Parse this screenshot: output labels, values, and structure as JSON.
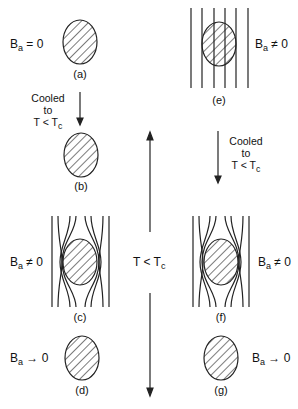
{
  "diagram": {
    "panels": [
      {
        "id": "a",
        "caption": "(a)",
        "field_label": "B",
        "field_sub": "a",
        "field_rel": " = 0"
      },
      {
        "id": "b",
        "caption": "(b)"
      },
      {
        "id": "c",
        "caption": "(c)",
        "field_label": "B",
        "field_sub": "a",
        "field_rel": " ≠ 0"
      },
      {
        "id": "d",
        "caption": "(d)",
        "field_label": "B",
        "field_sub": "a",
        "field_rel": " → 0"
      },
      {
        "id": "e",
        "caption": "(e)",
        "field_label": "B",
        "field_sub": "a",
        "field_rel": " ≠ 0"
      },
      {
        "id": "f",
        "caption": "(f)",
        "field_label": "B",
        "field_sub": "a",
        "field_rel": " ≠ 0"
      },
      {
        "id": "g",
        "caption": "(g)",
        "field_label": "B",
        "field_sub": "a",
        "field_rel": " → 0"
      }
    ],
    "cooling_left": {
      "line1": "Cooled",
      "line2": "to",
      "line3": "T < T",
      "sub": "c"
    },
    "cooling_right": {
      "line1": "Cooled",
      "line2": "to",
      "line3": "T < T",
      "sub": "c"
    },
    "center": {
      "label": "T < T",
      "sub": "c"
    }
  }
}
